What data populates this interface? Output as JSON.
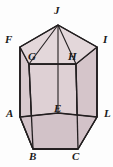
{
  "figure": {
    "name": "pentagonal-prism",
    "colors": {
      "background": "#fdfdfd",
      "face_front": "#ded0d4",
      "face_side_left": "#d8c9ce",
      "face_side_right": "#d5c5ca",
      "face_top": "#e3d7da",
      "face_top_right": "#d9cbd0",
      "face_bottom": "#d2c2c8",
      "outline": "#231f20",
      "label_color": "#1a1a1a"
    },
    "outline_width": 1.3,
    "labels": [
      {
        "id": "J",
        "text": "J",
        "x": 54,
        "y": 8,
        "vertex_x": 58,
        "vertex_y": 25
      },
      {
        "id": "F",
        "text": "F",
        "x": 6,
        "y": 36,
        "vertex_x": 20,
        "vertex_y": 47
      },
      {
        "id": "I",
        "text": "I",
        "x": 102,
        "y": 36,
        "vertex_x": 97,
        "vertex_y": 47
      },
      {
        "id": "G",
        "text": "G",
        "x": 28,
        "y": 53,
        "vertex_x": 29,
        "vertex_y": 64
      },
      {
        "id": "H",
        "text": "H",
        "x": 70,
        "y": 53,
        "vertex_x": 76,
        "vertex_y": 64
      },
      {
        "id": "A",
        "text": "A",
        "x": 7,
        "y": 110,
        "vertex_x": 20,
        "vertex_y": 117
      },
      {
        "id": "E",
        "text": "E",
        "x": 54,
        "y": 105,
        "vertex_x": 58,
        "vertex_y": 113
      },
      {
        "id": "D",
        "text": "L",
        "x": 101,
        "y": 110,
        "vertex_x": 97,
        "vertex_y": 117
      },
      {
        "id": "B",
        "text": "B",
        "x": 30,
        "y": 152,
        "vertex_x": 33,
        "vertex_y": 149
      },
      {
        "id": "C",
        "text": "C",
        "x": 73,
        "y": 152,
        "vertex_x": 78,
        "vertex_y": 149
      }
    ],
    "geometry": {
      "top_pentagon": [
        {
          "id": "J",
          "x": 58,
          "y": 25
        },
        {
          "id": "I",
          "x": 97,
          "y": 47
        },
        {
          "id": "H",
          "x": 76,
          "y": 64
        },
        {
          "id": "G",
          "x": 29,
          "y": 64
        },
        {
          "id": "F",
          "x": 20,
          "y": 47
        }
      ],
      "bottom_pentagon": [
        {
          "id": "E",
          "x": 58,
          "y": 113
        },
        {
          "id": "D",
          "x": 97,
          "y": 117
        },
        {
          "id": "C",
          "x": 78,
          "y": 149
        },
        {
          "id": "B",
          "x": 33,
          "y": 149
        },
        {
          "id": "A",
          "x": 20,
          "y": 117
        }
      ],
      "vertical_edges": [
        {
          "from": "F",
          "to": "A"
        },
        {
          "from": "G",
          "to": "B"
        },
        {
          "from": "H",
          "to": "C"
        },
        {
          "from": "I",
          "to": "D"
        },
        {
          "from": "J",
          "to": "E"
        }
      ]
    }
  }
}
